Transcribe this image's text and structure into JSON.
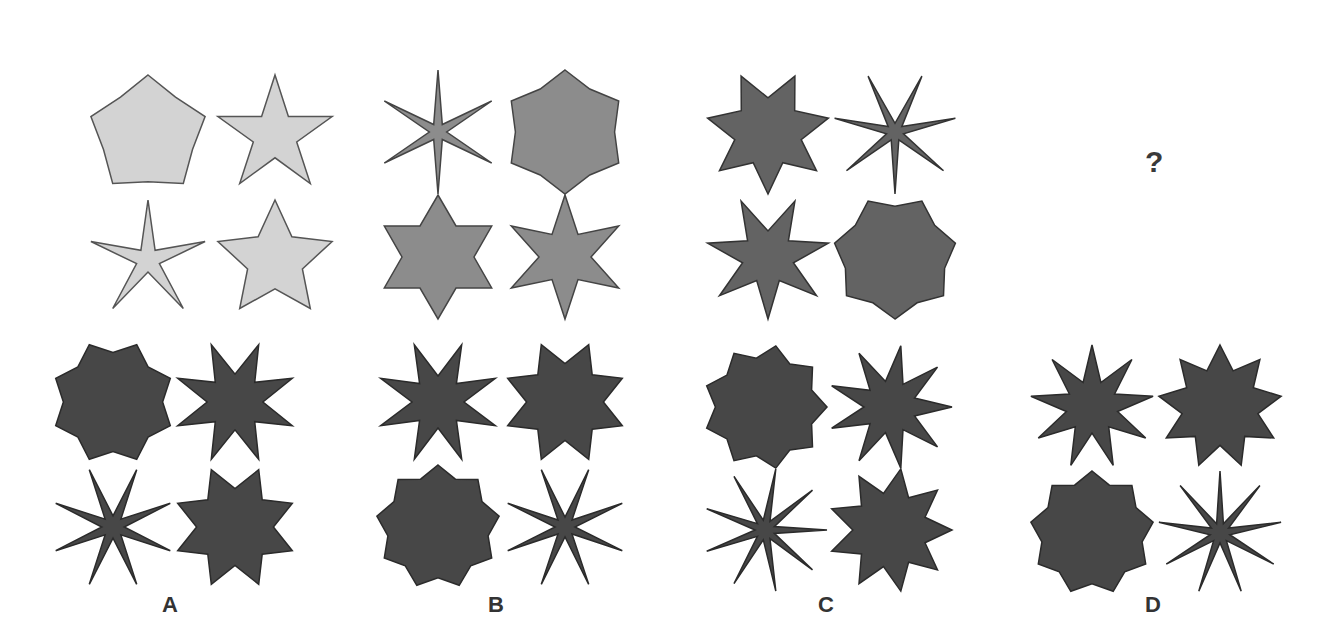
{
  "question": {
    "panels": [
      {
        "id": "q1",
        "x": 45,
        "y": 35,
        "fill": "#d3d3d3",
        "stroke": "#555555",
        "shapes": [
          {
            "cx": 103,
            "cy": 100,
            "r": 60,
            "points": 5,
            "inner": 0.78,
            "rot": 0
          },
          {
            "cx": 230,
            "cy": 100,
            "r": 60,
            "points": 5,
            "inner": 0.38,
            "rot": 0
          },
          {
            "cx": 103,
            "cy": 225,
            "r": 60,
            "points": 5,
            "inner": 0.2,
            "rot": 0
          },
          {
            "cx": 230,
            "cy": 225,
            "r": 60,
            "points": 5,
            "inner": 0.48,
            "rot": 0
          }
        ]
      },
      {
        "id": "q2",
        "x": 370,
        "y": 35,
        "fill": "#8c8c8c",
        "stroke": "#444444",
        "shapes": [
          {
            "cx": 68,
            "cy": 97,
            "r": 62,
            "points": 6,
            "inner": 0.14,
            "rot": 0
          },
          {
            "cx": 195,
            "cy": 97,
            "r": 62,
            "points": 6,
            "inner": 0.8,
            "rot": 0
          },
          {
            "cx": 68,
            "cy": 222,
            "r": 62,
            "points": 6,
            "inner": 0.58,
            "rot": 0
          },
          {
            "cx": 195,
            "cy": 222,
            "r": 62,
            "points": 6,
            "inner": 0.42,
            "rot": 0
          }
        ]
      },
      {
        "id": "q3",
        "x": 700,
        "y": 35,
        "fill": "#636363",
        "stroke": "#333333",
        "shapes": [
          {
            "cx": 68,
            "cy": 97,
            "r": 62,
            "points": 7,
            "inner": 0.55,
            "rot": 180
          },
          {
            "cx": 195,
            "cy": 97,
            "r": 62,
            "points": 7,
            "inner": 0.14,
            "rot": 180
          },
          {
            "cx": 68,
            "cy": 222,
            "r": 62,
            "points": 7,
            "inner": 0.42,
            "rot": 180
          },
          {
            "cx": 195,
            "cy": 222,
            "r": 62,
            "points": 7,
            "inner": 0.82,
            "rot": 180
          }
        ]
      }
    ],
    "question_mark": "?"
  },
  "options": [
    {
      "label": "A",
      "x": 45,
      "y": 335,
      "fill": "#474747",
      "stroke": "#2b2b2b",
      "shapes": [
        {
          "cx": 68,
          "cy": 67,
          "r": 62,
          "points": 8,
          "inner": 0.8,
          "rot": 22.5
        },
        {
          "cx": 190,
          "cy": 67,
          "r": 62,
          "points": 8,
          "inner": 0.45,
          "rot": 22.5
        },
        {
          "cx": 68,
          "cy": 192,
          "r": 62,
          "points": 8,
          "inner": 0.18,
          "rot": 22.5
        },
        {
          "cx": 190,
          "cy": 192,
          "r": 62,
          "points": 8,
          "inner": 0.62,
          "rot": 22.5
        }
      ]
    },
    {
      "label": "B",
      "x": 370,
      "y": 335,
      "fill": "#474747",
      "stroke": "#2b2b2b",
      "shapes": [
        {
          "cx": 68,
          "cy": 67,
          "r": 62,
          "points": 8,
          "inner": 0.42,
          "rot": 22.5
        },
        {
          "cx": 195,
          "cy": 67,
          "r": 62,
          "points": 8,
          "inner": 0.62,
          "rot": 22.5
        },
        {
          "cx": 68,
          "cy": 192,
          "r": 62,
          "points": 9,
          "inner": 0.82,
          "rot": 0
        },
        {
          "cx": 195,
          "cy": 192,
          "r": 62,
          "points": 8,
          "inner": 0.16,
          "rot": 22.5
        }
      ]
    },
    {
      "label": "C",
      "x": 700,
      "y": 335,
      "fill": "#474747",
      "stroke": "#2b2b2b",
      "shapes": [
        {
          "cx": 65,
          "cy": 72,
          "r": 62,
          "points": 9,
          "inner": 0.8,
          "rot": 10
        },
        {
          "cx": 190,
          "cy": 72,
          "r": 62,
          "points": 9,
          "inner": 0.42,
          "rot": 10
        },
        {
          "cx": 65,
          "cy": 195,
          "r": 62,
          "points": 9,
          "inner": 0.16,
          "rot": 10
        },
        {
          "cx": 190,
          "cy": 195,
          "r": 62,
          "points": 9,
          "inner": 0.6,
          "rot": 10
        }
      ]
    },
    {
      "label": "D",
      "x": 1030,
      "y": 335,
      "fill": "#474747",
      "stroke": "#2b2b2b",
      "shapes": [
        {
          "cx": 62,
          "cy": 72,
          "r": 62,
          "points": 9,
          "inner": 0.42,
          "rot": 0
        },
        {
          "cx": 190,
          "cy": 72,
          "r": 62,
          "points": 9,
          "inner": 0.62,
          "rot": 0
        },
        {
          "cx": 62,
          "cy": 198,
          "r": 62,
          "points": 9,
          "inner": 0.82,
          "rot": 0
        },
        {
          "cx": 190,
          "cy": 198,
          "r": 62,
          "points": 9,
          "inner": 0.16,
          "rot": 0
        }
      ]
    }
  ],
  "labels": {
    "A": "A",
    "B": "B",
    "C": "C",
    "D": "D"
  }
}
